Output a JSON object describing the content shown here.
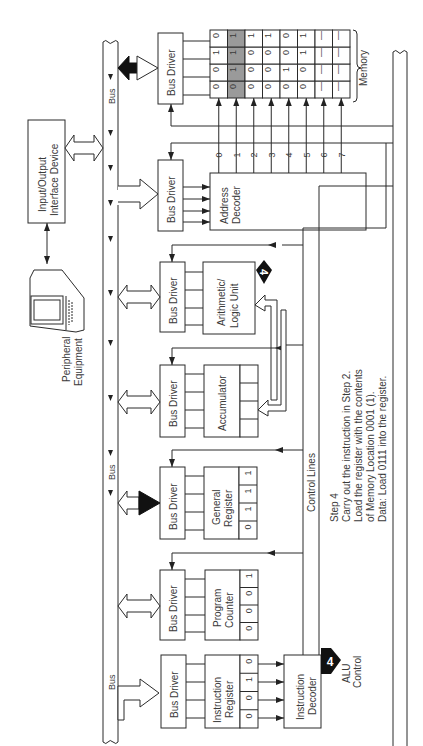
{
  "diagram": {
    "orientation": "rotated-90-ccw",
    "blocks": {
      "io_device": "Input/Output Interface Device",
      "peripheral": "Peripheral Equipment",
      "bus_driver": "Bus Driver",
      "address_decoder": "Address Decoder",
      "alu": "Arithmetic/ Logic Unit",
      "alu_line1": "Arithmetic/",
      "alu_line2": "Logic Unit",
      "accumulator": "Accumulator",
      "general_register_line1": "General",
      "general_register_line2": "Register",
      "program_counter_line1": "Program",
      "program_counter_line2": "Counter",
      "instruction_register_line1": "Instruction",
      "instruction_register_line2": "Register",
      "instruction_decoder_line1": "Instruction",
      "instruction_decoder_line2": "Decoder",
      "memory": "Memory",
      "control_lines": "Control Lines",
      "bus": "Bus",
      "alu_control_line1": "ALU",
      "alu_control_line2": "Control"
    },
    "step_badge": "4",
    "registers": {
      "general_register": [
        "0",
        "1",
        "1",
        "1"
      ],
      "program_counter": [
        "0",
        "0",
        "0",
        "1"
      ],
      "instruction_register": [
        "0",
        "0",
        "1",
        "0"
      ],
      "accumulator": [
        "",
        "",
        "",
        ""
      ]
    },
    "address_lines": [
      "0",
      "1",
      "2",
      "3",
      "4",
      "5",
      "6",
      "7"
    ],
    "memory_rows": [
      [
        "0",
        "0",
        "1",
        "0"
      ],
      [
        "0",
        "1",
        "1",
        "1"
      ],
      [
        "0",
        "0",
        "0",
        "1"
      ],
      [
        "0",
        "0",
        "0",
        "1"
      ],
      [
        "0",
        "1",
        "0",
        "0"
      ],
      [
        "0",
        "0",
        "1",
        "1"
      ],
      [
        "—",
        "—",
        "—",
        "—"
      ],
      [
        "—",
        "—",
        "—",
        "—"
      ]
    ],
    "highlighted_memory_row": 1,
    "step_text": {
      "title": "Step 4",
      "line1": "Carry out the instruction in Step 2.",
      "line2": "Load the register with the contents",
      "line3": "of Memory Location 0001 (1).",
      "line4": "Data:  Load 0111 into the register."
    },
    "colors": {
      "line": "#2a2a2a",
      "highlight": "#9a9a9a",
      "background": "#ffffff"
    }
  }
}
